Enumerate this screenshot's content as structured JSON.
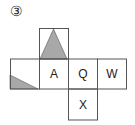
{
  "problem": {
    "number_label": "③"
  },
  "net": {
    "cells": [
      {
        "id": "top",
        "label": "",
        "shading": "isosceles-triangle"
      },
      {
        "id": "left",
        "label": "",
        "shading": "corner-triangle"
      },
      {
        "id": "a",
        "label": "A"
      },
      {
        "id": "q",
        "label": "Q"
      },
      {
        "id": "w",
        "label": "W"
      },
      {
        "id": "x",
        "label": "X"
      }
    ],
    "colors": {
      "line": "#555555",
      "fill": "#a8a8a8"
    }
  }
}
